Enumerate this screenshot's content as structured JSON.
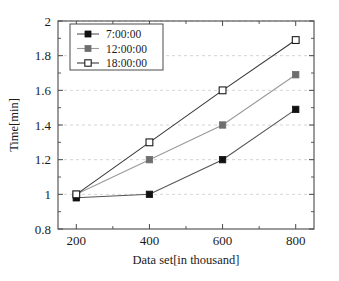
{
  "chart_data": {
    "type": "line",
    "title": "",
    "xlabel": "Data set[in thousand]",
    "ylabel": "Time[min]",
    "x": [
      200,
      400,
      600,
      800
    ],
    "categories": [
      "200",
      "400",
      "600",
      "800"
    ],
    "xtick_labels": [
      "200",
      "400",
      "600",
      "800"
    ],
    "ytick_labels": [
      "0.8",
      "1",
      "1.2",
      "1.4",
      "1.6",
      "1.8",
      "2"
    ],
    "ytick_values": [
      0.8,
      1,
      1.2,
      1.4,
      1.6,
      1.8,
      2
    ],
    "xlim": [
      150,
      850
    ],
    "ylim": [
      0.8,
      2
    ],
    "grid": "horizontal-dashed",
    "legend_position": "top-left-inside",
    "series": [
      {
        "name": "7:00:00",
        "values": [
          0.98,
          1.0,
          1.2,
          1.49
        ],
        "marker": "filled-square",
        "marker_color": "#111111",
        "line_color": "#555555"
      },
      {
        "name": "12:00:00",
        "values": [
          1.0,
          1.2,
          1.4,
          1.69
        ],
        "marker": "filled-square",
        "marker_color": "#6e6e6e",
        "line_color": "#9a9a9a"
      },
      {
        "name": "18:00:00",
        "values": [
          1.0,
          1.3,
          1.6,
          1.89
        ],
        "marker": "open-square",
        "marker_color": "#ffffff",
        "marker_edge_color": "#1b1b1b",
        "line_color": "#3a3a3a"
      }
    ]
  },
  "legend": {
    "entries": [
      {
        "label": "7:00:00"
      },
      {
        "label": "12:00:00"
      },
      {
        "label": "18:00:00"
      }
    ]
  },
  "axes": {
    "x_title": "Data set[in thousand]",
    "y_title": "Time[min]",
    "x_ticks": [
      "200",
      "400",
      "600",
      "800"
    ],
    "y_ticks": [
      "0.8",
      "1",
      "1.2",
      "1.4",
      "1.6",
      "1.8",
      "2"
    ]
  },
  "colors": {
    "frame": "#4a4a4a",
    "grid": "#c9c9c9",
    "background": "#ffffff",
    "series_1": "#111111",
    "series_2": "#6e6e6e",
    "series_3": "#ffffff"
  }
}
